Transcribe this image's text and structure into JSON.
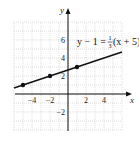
{
  "chart_data": {
    "type": "line",
    "title": "",
    "equation": "y − 1 = ⅓(x + 5)",
    "equation_parts": {
      "lhs": "y − 1 = ",
      "frac_num": "1",
      "frac_den": "3",
      "rhs": "(x + 5)"
    },
    "xlabel": "x",
    "ylabel": "y",
    "xlim": [
      -6,
      6
    ],
    "ylim": [
      -4,
      8
    ],
    "grid": true,
    "x_ticks": [
      "−4",
      "−2",
      "2",
      "4"
    ],
    "y_ticks": [
      "6",
      "4",
      "2",
      "−2"
    ],
    "series": [
      {
        "name": "y − 1 = 1/3(x + 5)",
        "slope": 0.3333,
        "intercept": 2.6667,
        "x": [
          -6,
          6
        ],
        "y": [
          0.667,
          4.667
        ]
      }
    ],
    "points": [
      {
        "x": -5,
        "y": 1
      },
      {
        "x": -2,
        "y": 2
      },
      {
        "x": 1,
        "y": 3
      }
    ]
  }
}
